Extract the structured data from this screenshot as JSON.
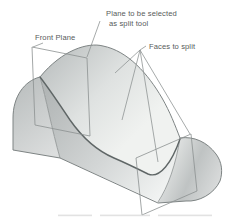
{
  "figure": {
    "background": "#ffffff",
    "labels": {
      "front_plane": "Front Plane",
      "split_tool_line1": "Plane to be selected",
      "split_tool_line2": "as split tool",
      "faces_to_split": "Faces to split"
    },
    "colors": {
      "text": "#575b5b",
      "outline": "#7e8484",
      "ridge": "#5f6666",
      "leader": "#8f9494",
      "plane_edge": "#8b9090",
      "face_light": "#f0f2f0",
      "face_mid": "#c6caca",
      "face_dark": "#b4b8b8"
    }
  }
}
